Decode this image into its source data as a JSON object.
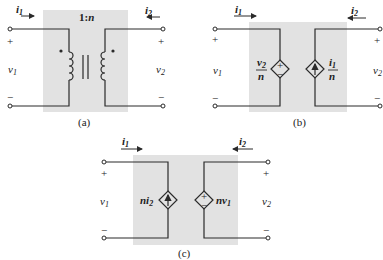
{
  "colors": {
    "shade": "#e2e2e2",
    "line": "#2a2a2a",
    "background": "#ffffff"
  },
  "panel_a": {
    "caption": "(a)",
    "ratio_label": "1:n",
    "i1": "i",
    "i1_sub": "1",
    "i2": "i",
    "i2_sub": "2",
    "v1": "v",
    "v1_sub": "1",
    "v2": "v",
    "v2_sub": "2",
    "plus": "+",
    "minus": "−",
    "element": "ideal-transformer"
  },
  "panel_b": {
    "caption": "(b)",
    "i1": "i",
    "i1_sub": "1",
    "i2": "i",
    "i2_sub": "2",
    "v1": "v",
    "v1_sub": "1",
    "v2": "v",
    "v2_sub": "2",
    "plus": "+",
    "minus": "−",
    "vsource_num": "v",
    "vsource_num_sub": "2",
    "vsource_den": "n",
    "vsource_sign_plus": "+",
    "vsource_sign_minus": "−",
    "isource_num": "i",
    "isource_num_sub": "1",
    "isource_den": "n"
  },
  "panel_c": {
    "caption": "(c)",
    "i1": "i",
    "i1_sub": "1",
    "i2": "i",
    "i2_sub": "2",
    "v1": "v",
    "v1_sub": "1",
    "v2": "v",
    "v2_sub": "2",
    "plus": "+",
    "minus": "−",
    "isource_label": "ni",
    "isource_label_sub": "2",
    "vsource_label": "nv",
    "vsource_label_sub": "1",
    "vsource_sign_plus": "+",
    "vsource_sign_minus": "−"
  }
}
